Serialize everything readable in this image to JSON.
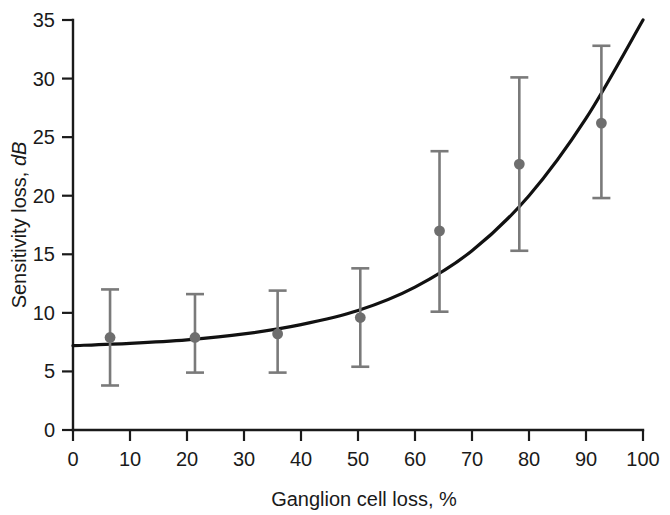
{
  "chart_data": {
    "type": "scatter",
    "title": "",
    "subtitle": "",
    "xlabel": "Ganglion cell loss, %",
    "xlabel_plain": "Ganglion cell loss, ",
    "xlabel_unit": "%",
    "ylabel": "Sensitivity loss, dB",
    "ylabel_plain": "Sensitivity loss, ",
    "ylabel_unit_italic": "dB",
    "xlim": [
      0,
      100
    ],
    "ylim": [
      0,
      35
    ],
    "xticks": [
      0,
      10,
      20,
      30,
      40,
      50,
      60,
      70,
      80,
      90,
      100
    ],
    "xtick_labels": [
      "0",
      "10",
      "20",
      "30",
      "40",
      "50",
      "60",
      "70",
      "80",
      "90",
      "100"
    ],
    "yticks": [
      0,
      5,
      10,
      15,
      20,
      25,
      30,
      35
    ],
    "ytick_labels": [
      "0",
      "5",
      "10",
      "15",
      "20",
      "25",
      "30",
      "35"
    ],
    "grid": false,
    "legend": false,
    "legend_position": "none",
    "marker_color": "#6e6e6e",
    "errorbar_color": "#7a7a7a",
    "curve_color": "#111111",
    "axis_color": "#1a1a1a",
    "series": [
      {
        "name": "Mean sensitivity loss with 95% CI",
        "marker": "filled-circle",
        "x": [
          6.5,
          21.4,
          35.9,
          50.4,
          64.3,
          78.3,
          92.7
        ],
        "y": [
          7.9,
          7.9,
          8.2,
          9.6,
          17.0,
          22.7,
          26.2
        ],
        "y_upper": [
          12.0,
          11.6,
          11.9,
          13.8,
          23.8,
          30.1,
          32.8
        ],
        "y_lower": [
          3.8,
          4.9,
          4.9,
          5.4,
          10.1,
          15.3,
          19.8
        ]
      },
      {
        "name": "Fitted exponential curve",
        "type": "line",
        "x": [
          0,
          10,
          20,
          30,
          40,
          50,
          60,
          70,
          80,
          90,
          100
        ],
        "y": [
          7.2,
          7.4,
          7.7,
          8.2,
          9.0,
          10.2,
          12.2,
          15.3,
          20.0,
          26.6,
          35.0
        ]
      }
    ],
    "annotations": []
  }
}
